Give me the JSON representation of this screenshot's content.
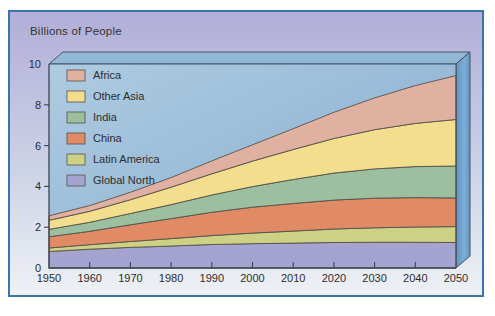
{
  "chart_data": {
    "type": "area",
    "stacked": true,
    "title": "Billions of People",
    "ylabel": "Billions of People",
    "xlim": [
      1950,
      2050
    ],
    "ylim": [
      0,
      10
    ],
    "grid": false,
    "legend_position": "upper-left-inside",
    "projection": "3d-extruded-box",
    "x": [
      1950,
      1960,
      1970,
      1980,
      1990,
      2000,
      2010,
      2020,
      2030,
      2040,
      2050
    ],
    "xtick_labels": [
      "1950",
      "1960",
      "1970",
      "1980",
      "1990",
      "2000",
      "2010",
      "2020",
      "2030",
      "2040",
      "2050"
    ],
    "ytick_values": [
      0,
      2,
      4,
      6,
      8,
      10
    ],
    "ytick_labels": [
      "0",
      "2",
      "4",
      "6",
      "8",
      "10"
    ],
    "stack_note": "series listed top-to-bottom as shown in legend; stacked bottom-to-top in reverse order (Global North is the bottom band)",
    "series": [
      {
        "name": "Africa",
        "color": "#e0b0a1",
        "values": [
          0.22,
          0.28,
          0.36,
          0.47,
          0.63,
          0.8,
          1.02,
          1.28,
          1.56,
          1.85,
          2.15
        ]
      },
      {
        "name": "Other Asia",
        "color": "#f3de8d",
        "values": [
          0.45,
          0.54,
          0.68,
          0.85,
          1.04,
          1.25,
          1.47,
          1.7,
          1.92,
          2.12,
          2.28
        ]
      },
      {
        "name": "India",
        "color": "#9cbf9f",
        "values": [
          0.36,
          0.44,
          0.55,
          0.69,
          0.85,
          1.01,
          1.18,
          1.32,
          1.44,
          1.52,
          1.57
        ]
      },
      {
        "name": "China",
        "color": "#e08b66",
        "values": [
          0.55,
          0.66,
          0.82,
          0.98,
          1.14,
          1.27,
          1.35,
          1.42,
          1.45,
          1.44,
          1.4
        ]
      },
      {
        "name": "Latin America",
        "color": "#cdd186",
        "values": [
          0.17,
          0.22,
          0.29,
          0.36,
          0.44,
          0.52,
          0.59,
          0.66,
          0.71,
          0.75,
          0.78
        ]
      },
      {
        "name": "Global North",
        "color": "#a5a4d1",
        "values": [
          0.81,
          0.92,
          1.01,
          1.08,
          1.15,
          1.19,
          1.22,
          1.25,
          1.26,
          1.26,
          1.25
        ]
      }
    ],
    "colors": {
      "plot_bg_top": "#aecbe0",
      "plot_bg_bottom": "#86abd0",
      "box_top_face": "#93b8d6",
      "box_side_face_dark": "#6095c3",
      "box_side_face_light": "#7fadd6",
      "box_edge": "#44546a",
      "axis": "#3c4450",
      "band_outline": "#56524a",
      "text": "#2d2d2d",
      "figure_border": "#3b74ab",
      "figure_bg_top": "#b2aed8",
      "figure_bg_mid": "#ccd2e6",
      "figure_bg_bottom": "#eef1f5"
    }
  }
}
